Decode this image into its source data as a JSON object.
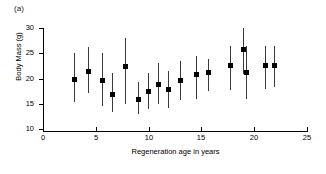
{
  "figure": {
    "panel_label": "(a)"
  },
  "chart_data": {
    "type": "scatter",
    "title": "",
    "xlabel": "Regeneration age in years",
    "ylabel": "Body Mass (g)",
    "xlim": [
      0,
      25
    ],
    "ylim": [
      10,
      30
    ],
    "xticks": [
      0,
      5,
      10,
      15,
      20,
      25
    ],
    "yticks": [
      10,
      15,
      20,
      25,
      30
    ],
    "xtick_labels": [
      "0",
      "5",
      "10",
      "15",
      "20",
      "25"
    ],
    "ytick_labels": [
      "10",
      "15",
      "20",
      "25",
      "30"
    ],
    "grid": false,
    "legend": null,
    "marker": "filled-square",
    "error_bars": "vertical",
    "points": [
      {
        "x": 2.9,
        "y": 19.9,
        "y_low": 15.2,
        "y_high": 25.0
      },
      {
        "x": 4.3,
        "y": 21.4,
        "y_low": 17.1,
        "y_high": 26.2
      },
      {
        "x": 5.6,
        "y": 19.8,
        "y_low": 14.6,
        "y_high": 25.0
      },
      {
        "x": 6.5,
        "y": 17.0,
        "y_low": 13.2,
        "y_high": 21.0
      },
      {
        "x": 7.8,
        "y": 22.5,
        "y_low": 15.0,
        "y_high": 28.1
      },
      {
        "x": 9.0,
        "y": 15.9,
        "y_low": 13.0,
        "y_high": 19.4
      },
      {
        "x": 9.9,
        "y": 17.5,
        "y_low": 14.0,
        "y_high": 21.1
      },
      {
        "x": 10.9,
        "y": 19.0,
        "y_low": 14.9,
        "y_high": 23.1
      },
      {
        "x": 11.8,
        "y": 17.9,
        "y_low": 14.2,
        "y_high": 21.5
      },
      {
        "x": 13.0,
        "y": 19.8,
        "y_low": 15.8,
        "y_high": 23.5
      },
      {
        "x": 14.5,
        "y": 20.8,
        "y_low": 15.9,
        "y_high": 24.5
      },
      {
        "x": 15.6,
        "y": 21.3,
        "y_low": 17.5,
        "y_high": 23.8
      },
      {
        "x": 17.7,
        "y": 22.6,
        "y_low": 17.7,
        "y_high": 26.4
      },
      {
        "x": 18.9,
        "y": 25.8,
        "y_low": 20.9,
        "y_high": 30.0
      },
      {
        "x": 19.2,
        "y": 21.3,
        "y_low": 16.0,
        "y_high": 26.4
      },
      {
        "x": 21.0,
        "y": 22.6,
        "y_low": 18.0,
        "y_high": 26.5
      },
      {
        "x": 21.9,
        "y": 22.6,
        "y_low": 18.3,
        "y_high": 26.5
      }
    ]
  }
}
